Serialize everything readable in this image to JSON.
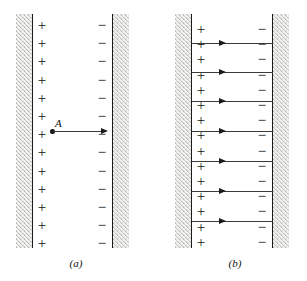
{
  "figure": {
    "background_color": "#ffffff",
    "line_color": "#1a1a1a",
    "plate_fill_color": "#f2f2f0",
    "stipple_color": "#6e6e6e"
  },
  "panels": [
    {
      "id": "a",
      "caption": "(a)",
      "positive_sign": "+",
      "negative_sign": "−",
      "positive_count": 13,
      "negative_count": 13,
      "point_label": "A",
      "field_arrow_count": 1,
      "description": "Single field vector at point A pointing from positive plate toward negative plate"
    },
    {
      "id": "b",
      "caption": "(b)",
      "positive_sign": "+",
      "negative_sign": "−",
      "positive_count": 15,
      "negative_count": 15,
      "field_arrow_count": 7,
      "description": "Uniform electric field represented by seven parallel field lines pointing from positive plate to negative plate"
    }
  ],
  "chart_data": {
    "type": "diagram",
    "panel_a": {
      "label": "(a)",
      "plus_signs": 13,
      "minus_signs": 13,
      "vectors": [
        {
          "label": "A",
          "direction": "right",
          "start_x": 52,
          "y": 131,
          "length": 56
        }
      ]
    },
    "panel_b": {
      "label": "(b)",
      "plus_signs": 15,
      "minus_signs": 15,
      "field_lines": [
        {
          "index": 1,
          "y": 43,
          "direction": "right"
        },
        {
          "index": 2,
          "y": 72,
          "direction": "right"
        },
        {
          "index": 3,
          "y": 101,
          "direction": "right"
        },
        {
          "index": 4,
          "y": 131,
          "direction": "right"
        },
        {
          "index": 5,
          "y": 161,
          "direction": "right"
        },
        {
          "index": 6,
          "y": 191,
          "direction": "right"
        },
        {
          "index": 7,
          "y": 221,
          "direction": "right"
        }
      ]
    }
  }
}
